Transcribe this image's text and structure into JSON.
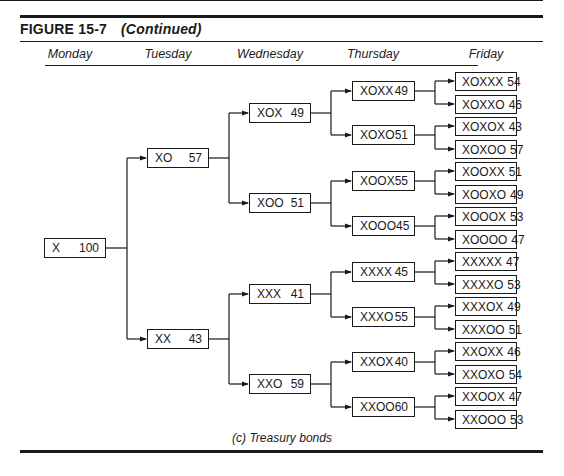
{
  "figure": {
    "label": "FIGURE 15-7",
    "continued": "(Continued)",
    "caption": "(c) Treasury bonds"
  },
  "days": [
    "Monday",
    "Tuesday",
    "Wednesday",
    "Thursday",
    "Friday"
  ],
  "nodes": {
    "monday": [
      {
        "label": "X",
        "value": "100"
      }
    ],
    "tuesday": [
      {
        "label": "XO",
        "value": "57"
      },
      {
        "label": "XX",
        "value": "43"
      }
    ],
    "wednesday": [
      {
        "label": "XOX",
        "value": "49"
      },
      {
        "label": "XOO",
        "value": "51"
      },
      {
        "label": "XXX",
        "value": "41"
      },
      {
        "label": "XXO",
        "value": "59"
      }
    ],
    "thursday": [
      {
        "label": "XOXX",
        "value": "49"
      },
      {
        "label": "XOXO",
        "value": "51"
      },
      {
        "label": "XOOX",
        "value": "55"
      },
      {
        "label": "XOOO",
        "value": "45"
      },
      {
        "label": "XXXX",
        "value": "45"
      },
      {
        "label": "XXXO",
        "value": "55"
      },
      {
        "label": "XXOX",
        "value": "40"
      },
      {
        "label": "XXOO",
        "value": "60"
      }
    ],
    "friday": [
      {
        "label": "XOXXX",
        "value": "54"
      },
      {
        "label": "XOXXO",
        "value": "46"
      },
      {
        "label": "XOXOX",
        "value": "43"
      },
      {
        "label": "XOXOO",
        "value": "57"
      },
      {
        "label": "XOOXX",
        "value": "51"
      },
      {
        "label": "XOOXO",
        "value": "49"
      },
      {
        "label": "XOOOX",
        "value": "53"
      },
      {
        "label": "XOOOO",
        "value": "47"
      },
      {
        "label": "XXXXX",
        "value": "47"
      },
      {
        "label": "XXXXO",
        "value": "53"
      },
      {
        "label": "XXXOX",
        "value": "49"
      },
      {
        "label": "XXXOO",
        "value": "51"
      },
      {
        "label": "XXOXX",
        "value": "46"
      },
      {
        "label": "XXOXO",
        "value": "54"
      },
      {
        "label": "XXOOX",
        "value": "47"
      },
      {
        "label": "XXOOO",
        "value": "53"
      }
    ]
  }
}
